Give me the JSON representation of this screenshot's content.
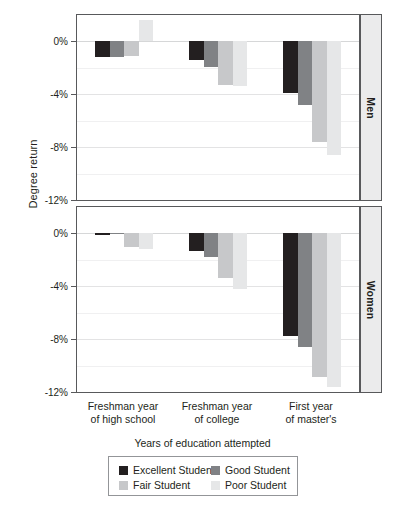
{
  "chart_data": {
    "type": "bar",
    "title": "",
    "xlabel": "Years of education attempted",
    "ylabel": "Degree return",
    "ylim": [
      -12,
      2
    ],
    "yticks": [
      0,
      -4,
      -8,
      -12
    ],
    "ytick_labels": [
      "0%",
      "-4%",
      "-8%",
      "-12%"
    ],
    "grid": true,
    "legend_position": "bottom",
    "categories": [
      "Freshman year of high school",
      "Freshman year of college",
      "First year of master's"
    ],
    "category_lines": [
      [
        "Freshman year",
        "of high school"
      ],
      [
        "Freshman year",
        "of college"
      ],
      [
        "First year",
        "of master's"
      ]
    ],
    "facets": [
      {
        "name": "Men",
        "series": [
          {
            "name": "Excellent Student",
            "color": "#231f20",
            "values": [
              -1.2,
              -1.4,
              -3.9
            ]
          },
          {
            "name": "Good Student",
            "color": "#808285",
            "values": [
              -1.2,
              -1.9,
              -4.8
            ]
          },
          {
            "name": "Fair Student",
            "color": "#c7c8ca",
            "values": [
              -1.1,
              -3.3,
              -7.6
            ]
          },
          {
            "name": "Poor Student",
            "color": "#e6e7e8",
            "values": [
              1.6,
              -3.4,
              -8.6
            ]
          }
        ]
      },
      {
        "name": "Women",
        "series": [
          {
            "name": "Excellent Student",
            "color": "#231f20",
            "values": [
              -0.15,
              -1.3,
              -7.8
            ]
          },
          {
            "name": "Good Student",
            "color": "#808285",
            "values": [
              0.0,
              -1.8,
              -8.6
            ]
          },
          {
            "name": "Fair Student",
            "color": "#c7c8ca",
            "values": [
              -1.0,
              -3.4,
              -10.9
            ]
          },
          {
            "name": "Poor Student",
            "color": "#e6e7e8",
            "values": [
              -1.2,
              -4.2,
              -11.6
            ]
          }
        ]
      }
    ]
  },
  "legend": {
    "items": [
      {
        "label": "Excellent Student",
        "color": "#231f20"
      },
      {
        "label": "Good Student",
        "color": "#808285"
      },
      {
        "label": "Fair Student",
        "color": "#c7c8ca"
      },
      {
        "label": "Poor Student",
        "color": "#e6e7e8"
      }
    ]
  },
  "strips": {
    "men": "Men",
    "women": "Women"
  },
  "axes": {
    "y_title": "Degree return",
    "x_title": "Years of education attempted"
  }
}
